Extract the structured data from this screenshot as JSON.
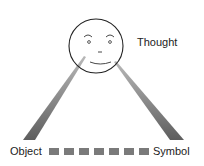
{
  "diagram": {
    "nodes": {
      "thought": {
        "label": "Thought"
      },
      "object": {
        "label": "Object"
      },
      "symbol": {
        "label": "Symbol"
      }
    },
    "link_squares_count": 7,
    "colors": {
      "beam": "#6e6e6e",
      "square": "#7a7a7a",
      "face_stroke": "#222222",
      "text": "#222222"
    }
  }
}
